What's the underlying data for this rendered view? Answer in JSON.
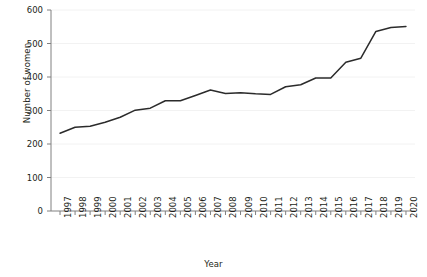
{
  "chart_data": {
    "type": "line",
    "title": "",
    "subtitle": "",
    "xlabel": "Year",
    "ylabel": "Number of women",
    "grid": true,
    "legend": false,
    "legend_position": "none",
    "line_color": "#2b2b2b",
    "grid_color": "#f2f2f2",
    "axis_color": "#808080",
    "xlim": [
      1996.4,
      2020.6
    ],
    "ylim": [
      0,
      600
    ],
    "yticks": [
      0,
      100,
      200,
      300,
      400,
      500,
      600
    ],
    "ytick_labels": [
      "0",
      "100",
      "200",
      "300",
      "400",
      "500",
      "600"
    ],
    "categories": [
      "1997",
      "1998",
      "1999",
      "2000",
      "2001",
      "2002",
      "2003",
      "2004",
      "2005",
      "2006",
      "2007",
      "2008",
      "2009",
      "2010",
      "2011",
      "2012",
      "2013",
      "2014",
      "2015",
      "2016",
      "2017",
      "2018",
      "2019",
      "2020"
    ],
    "x": [
      1997,
      1998,
      1999,
      2000,
      2001,
      2002,
      2003,
      2004,
      2005,
      2006,
      2007,
      2008,
      2009,
      2010,
      2011,
      2012,
      2013,
      2014,
      2015,
      2016,
      2017,
      2018,
      2019,
      2020
    ],
    "series": [
      {
        "name": "Number of women",
        "values": [
          232,
          250,
          253,
          265,
          280,
          301,
          307,
          329,
          329,
          345,
          361,
          351,
          353,
          350,
          348,
          371,
          377,
          397,
          397,
          444,
          456,
          536,
          548,
          551
        ]
      }
    ]
  }
}
